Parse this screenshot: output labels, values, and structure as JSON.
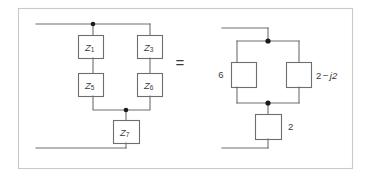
{
  "figure": {
    "caption": "",
    "equals_symbol": "=",
    "frame_color": "#c9c9c9",
    "wire_color": "#6e6e6e",
    "node_color": "#1a1a1a",
    "background": "#ffffff"
  },
  "left_circuit": {
    "name": "impedance-network-symbolic",
    "components": [
      {
        "id": "z1",
        "label": "Z",
        "subscript": "1",
        "label_position": "inside"
      },
      {
        "id": "z3",
        "label": "Z",
        "subscript": "3",
        "label_position": "inside"
      },
      {
        "id": "z5",
        "label": "Z",
        "subscript": "5",
        "label_position": "inside"
      },
      {
        "id": "z6",
        "label": "Z",
        "subscript": "6",
        "label_position": "inside"
      },
      {
        "id": "z7",
        "label": "Z",
        "subscript": "7",
        "label_position": "inside"
      }
    ]
  },
  "right_circuit": {
    "name": "impedance-network-numeric",
    "components": [
      {
        "id": "r-left",
        "label": "6",
        "label_position": "left"
      },
      {
        "id": "r-right",
        "label_real": "2",
        "label_operator": "−",
        "label_imag": "j2",
        "label_position": "right"
      },
      {
        "id": "r-series",
        "label": "2",
        "label_position": "right"
      }
    ]
  }
}
